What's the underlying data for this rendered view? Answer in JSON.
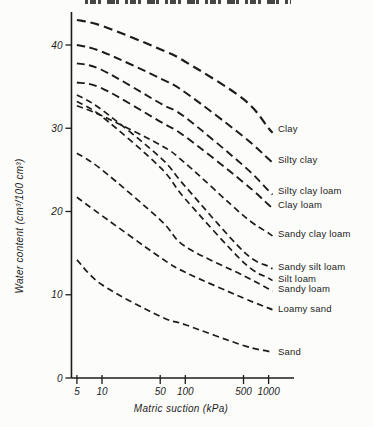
{
  "page": {
    "background": "#fcfcfa",
    "ink": "#1c1c1c",
    "cropped_title": {
      "visible": true,
      "legible": false
    }
  },
  "chart_data": {
    "type": "line",
    "line_style": "dashed",
    "x_scale": "log",
    "grid": false,
    "legend_position": "right-of-curve-ends",
    "xlabel": "Matric suction  (kPa)",
    "ylabel": "Water content (cm³/100 cm³)",
    "x": [
      5,
      10,
      50,
      100,
      500,
      1000
    ],
    "x_tick_labels": [
      "5",
      "10",
      "50",
      "100",
      "500",
      "1000"
    ],
    "y_ticks": [
      0,
      10,
      20,
      30,
      40
    ],
    "y_tick_labels": [
      "0",
      "10",
      "20",
      "30",
      "40"
    ],
    "xlim": [
      4,
      1800
    ],
    "ylim": [
      0,
      44
    ],
    "series": [
      {
        "name": "Clay",
        "values": [
          43.0,
          42.3,
          39.5,
          38.0,
          33.5,
          30.0
        ]
      },
      {
        "name": "Silty clay",
        "values": [
          40.0,
          39.2,
          36.0,
          34.3,
          29.0,
          26.3
        ]
      },
      {
        "name": "Silty clay loam",
        "values": [
          37.8,
          37.0,
          33.0,
          31.3,
          25.5,
          22.5
        ]
      },
      {
        "name": "Clay loam",
        "values": [
          35.5,
          34.8,
          30.8,
          29.0,
          23.5,
          20.8
        ]
      },
      {
        "name": "Sandy silt loam",
        "values": [
          34.0,
          32.2,
          26.5,
          23.0,
          15.2,
          13.4
        ]
      },
      {
        "name": "Silt loam",
        "values": [
          33.2,
          31.4,
          25.3,
          21.5,
          13.9,
          12.0
        ]
      },
      {
        "name": "Sandy clay loam",
        "values": [
          32.7,
          31.5,
          28.0,
          25.8,
          19.5,
          17.4
        ]
      },
      {
        "name": "Sandy loam",
        "values": [
          27.0,
          25.0,
          19.0,
          15.8,
          12.3,
          10.7
        ]
      },
      {
        "name": "Loamy sand",
        "values": [
          21.7,
          19.5,
          14.5,
          12.7,
          9.6,
          8.4
        ]
      },
      {
        "name": "Sand",
        "values": [
          14.2,
          11.2,
          7.4,
          6.4,
          3.9,
          3.2
        ]
      }
    ]
  }
}
